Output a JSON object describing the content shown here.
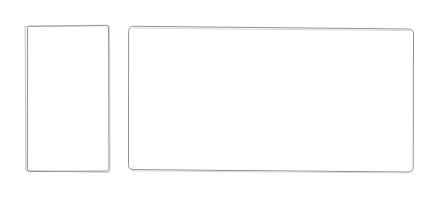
{
  "canvas": {
    "width": 435,
    "height": 197,
    "background_color": "#ffffff",
    "description": "Blank white page with two empty outlined rectangular frames"
  },
  "style": {
    "stroke_color": "#8f8f8f",
    "shadow_stroke_color": "#c2c2c2",
    "faint_stroke_color": "#d8d8d8",
    "stroke_width": 1,
    "fill_color": "#ffffff"
  },
  "shapes": [
    {
      "id": "portrait-frame",
      "name": "left-portrait-frame",
      "type": "rectangle",
      "orientation": "portrait",
      "content": "",
      "x": 25,
      "y": 25,
      "width": 83,
      "height": 146,
      "corner_radius": 2,
      "rotation_deg": -0.4,
      "has_double_contour": true,
      "contour_offset": 2
    },
    {
      "id": "landscape-frame",
      "name": "right-landscape-frame",
      "type": "rectangle",
      "orientation": "landscape",
      "content": "",
      "x": 128,
      "y": 26,
      "width": 285,
      "height": 146,
      "corner_radius": 6,
      "rotation_deg": 0.6,
      "has_double_contour": false,
      "contour_offset": 0
    }
  ]
}
